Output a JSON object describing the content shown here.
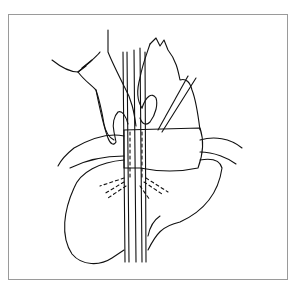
{
  "figure": {
    "colors": {
      "background": "#ffffff",
      "line": "#111111",
      "frame": "#9a9a9a"
    }
  }
}
